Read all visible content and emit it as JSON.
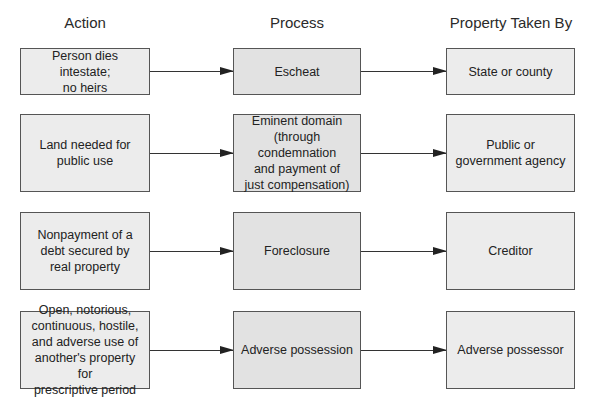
{
  "headers": {
    "action": "Action",
    "process": "Process",
    "taken_by": "Property Taken By"
  },
  "rows": [
    {
      "action": "Person dies intestate;\nno heirs",
      "process": "Escheat",
      "taken_by": "State or county"
    },
    {
      "action": "Land needed for\npublic use",
      "process": "Eminent domain\n(through condemnation\nand payment of\njust compensation)",
      "taken_by": "Public or\ngovernment agency"
    },
    {
      "action": "Nonpayment of a\ndebt secured by\nreal property",
      "process": "Foreclosure",
      "taken_by": "Creditor"
    },
    {
      "action": "Open, notorious,\ncontinuous, hostile,\nand adverse use of\nanother's property for\nprescriptive period",
      "process": "Adverse possession",
      "taken_by": "Adverse possessor"
    }
  ],
  "colors": {
    "box_border": "#555555",
    "box_fill": "#ececec",
    "process_fill": "#e2e2e2",
    "arrow": "#222222"
  }
}
